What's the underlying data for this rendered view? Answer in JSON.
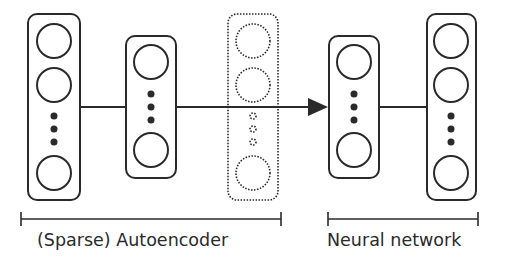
{
  "diagram": {
    "colors": {
      "stroke": "#2a2a2a",
      "background": "#ffffff"
    },
    "layers": [
      {
        "name": "input-layer",
        "style": "solid",
        "x": 28,
        "y": 14,
        "w": 52,
        "h": 186
      },
      {
        "name": "hidden-layer",
        "style": "solid",
        "x": 126,
        "y": 36,
        "w": 50,
        "h": 142
      },
      {
        "name": "reconstruction-layer",
        "style": "dotted",
        "x": 228,
        "y": 14,
        "w": 50,
        "h": 186
      },
      {
        "name": "nn-hidden-layer",
        "style": "solid",
        "x": 329,
        "y": 36,
        "w": 50,
        "h": 142
      },
      {
        "name": "output-layer",
        "style": "solid",
        "x": 427,
        "y": 14,
        "w": 49,
        "h": 186
      }
    ],
    "groups": [
      {
        "label": "(Sparse) Autoencoder",
        "x1": 21,
        "x2": 281
      },
      {
        "label": "Neural network",
        "x1": 328,
        "x2": 478
      }
    ]
  }
}
